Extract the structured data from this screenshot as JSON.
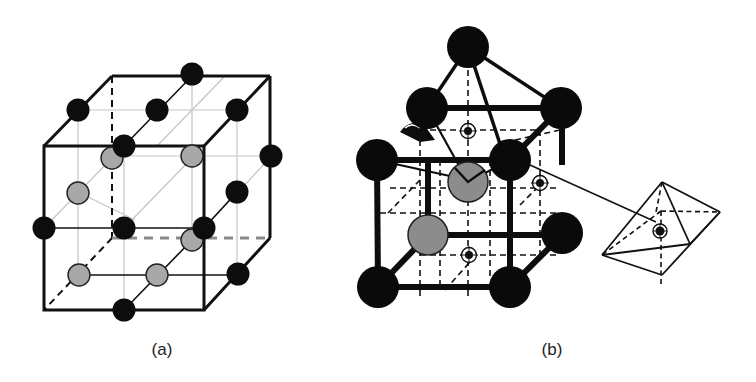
{
  "figure": {
    "panels": [
      {
        "id": "a",
        "label": "(a)",
        "description": "Cubic unit cell with black atoms on edges/corners and gray atoms on face centers",
        "colors": {
          "edge": "#111111",
          "black_atom": "#0d0d0d",
          "gray_atom": "#a8a8a8",
          "thin_line": "#bdbdbd",
          "dashed": "#777777"
        }
      },
      {
        "id": "b",
        "label": "(b)",
        "description": "Crystal cell with large black atoms at corners, gray atoms inside, interstitial sites marked by crossed circles, with inset octahedron",
        "colors": {
          "edge": "#0d0d0d",
          "black_atom": "#0a0a0a",
          "gray_atom": "#8c8c8c"
        }
      }
    ],
    "inset": {
      "label": "octahedron-inset"
    }
  }
}
